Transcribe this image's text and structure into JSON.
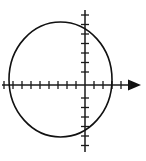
{
  "figure": {
    "title": "",
    "background_color": "#ffffff",
    "stroke_color": "#111111",
    "axis_color": "#1a1a1a",
    "width": 146,
    "height": 161
  },
  "chart_data": {
    "type": "scatter",
    "title": "",
    "subtitle": "",
    "xlabel": "",
    "ylabel": "",
    "grid": false,
    "legend": null,
    "legend_position": "none",
    "description": "Hand-drawn circle plotted on a pair of tick-marked coordinate axes; the x-axis carries a solid arrowhead on the right end.",
    "axes": {
      "origin_px": [
        85,
        85
      ],
      "x_axis": {
        "start_px": [
          2,
          85
        ],
        "end_px": [
          141,
          85
        ],
        "arrow_at": "right",
        "tick_spacing_px": 9,
        "tick_half_length_px": 4,
        "tick_positions_px": [
          4,
          13,
          22,
          31,
          40,
          49,
          58,
          67,
          76,
          94,
          103,
          112,
          121,
          130
        ],
        "tick_values": [
          -9,
          -8,
          -7,
          -6,
          -5,
          -4,
          -3,
          -2,
          -1,
          1,
          2,
          3,
          4,
          5
        ],
        "tick_labels": [],
        "xlim": [
          -9.2,
          6.2
        ]
      },
      "y_axis": {
        "start_px": [
          85,
          10
        ],
        "end_px": [
          85,
          152
        ],
        "arrow_at": "none",
        "tick_spacing_px": 9.5,
        "tick_half_length_px": 4,
        "tick_positions_px": [
          15,
          24.5,
          34,
          43.5,
          53,
          62.5,
          72,
          98,
          107.5,
          117,
          126.5,
          136,
          145.5
        ],
        "tick_values": [
          7,
          6,
          5,
          4,
          3,
          2,
          1,
          -1,
          -2,
          -3,
          -4,
          -5,
          -6
        ],
        "tick_labels": [],
        "ylim": [
          -7.9,
          7.9
        ]
      }
    },
    "shapes": [
      {
        "name": "circle",
        "kind": "ellipse",
        "center_px": [
          60.5,
          79.5
        ],
        "radius_x_px": 51.5,
        "radius_y_px": 57.5,
        "center_units": [
          -2.7,
          0.6
        ],
        "radius_x_units": 5.7,
        "radius_y_units": 6.1,
        "stroke_width_px": 1.6,
        "filled": false
      }
    ],
    "series": [],
    "annotations": []
  }
}
